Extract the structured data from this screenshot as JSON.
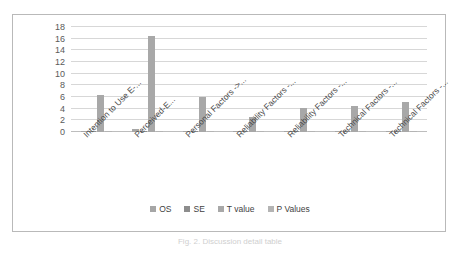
{
  "caption": "Fig. 2. Discussion detail table",
  "chart_data": {
    "type": "bar",
    "title": "",
    "xlabel": "",
    "ylabel": "",
    "ylim": [
      0,
      18
    ],
    "grid": true,
    "legend_position": "bottom",
    "categories": [
      "Intention to Use E-...",
      "Perceived-E...",
      "Personal Factors ->...",
      "Reliability Factors -...",
      "Reliability Factors -...",
      "Technical Factors -...",
      "Technical Factors -..."
    ],
    "yticks": [
      18,
      16,
      14,
      12,
      10,
      8,
      6,
      4,
      2,
      0
    ],
    "series": [
      {
        "name": "OS",
        "color": "#a6a6a6",
        "values": [
          0.15,
          0.55,
          0.12,
          0.1,
          0.12,
          0.13,
          0.22
        ]
      },
      {
        "name": "SE",
        "color": "#8d8d8d",
        "values": [
          0.08,
          0.2,
          0.07,
          0.06,
          0.07,
          0.07,
          0.1
        ]
      },
      {
        "name": "T value",
        "color": "#a8a8a8",
        "values": [
          6.3,
          16.5,
          6.0,
          2.6,
          4.1,
          4.5,
          5.2
        ]
      },
      {
        "name": "P Values",
        "color": "#b4b4b4",
        "values": [
          0.05,
          0.05,
          0.04,
          0.04,
          0.04,
          0.04,
          0.05
        ]
      }
    ]
  }
}
